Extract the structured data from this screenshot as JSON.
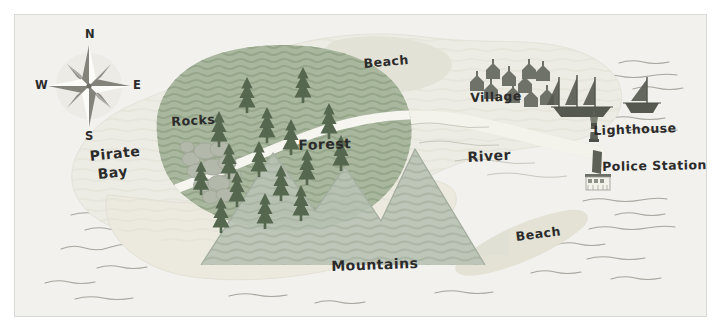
{
  "map": {
    "title": "Pirate Island Map",
    "style": "hand-drawn illustrated map",
    "colors": {
      "paper": "#f3f2ee",
      "water": "#f0efec",
      "sand": "#ecebe4",
      "land": "#e6e5dc",
      "beach_highlight": "#e2e1d6",
      "forest": "#a9b79e",
      "forest_dark": "#9aa98e",
      "tree": "#55684f",
      "mountain": "#b9c2b4",
      "mountain_dark": "#a8b2a2",
      "rocks": "#b0b7a8",
      "river": "#f7f7f4",
      "ink": "#2b2b2b",
      "wave": "#8d8d86",
      "border": "#d8d8d6",
      "building": "#6e7268",
      "lighthouse_body": "#5c6057",
      "police_roof": "#6b6f66"
    },
    "labels": [
      {
        "id": "pirate-bay",
        "text": "Pirate",
        "x": 88,
        "y": 148,
        "size": "lg",
        "rotate": -6
      },
      {
        "id": "pirate-bay-2",
        "text": "Bay",
        "x": 96,
        "y": 168,
        "size": "lg",
        "rotate": -6
      },
      {
        "id": "rocks",
        "text": "Rocks",
        "x": 170,
        "y": 113,
        "size": "md",
        "rotate": -3
      },
      {
        "id": "forest",
        "text": "Forest",
        "x": 297,
        "y": 136,
        "size": "lg",
        "rotate": -2
      },
      {
        "id": "beach-north",
        "text": "Beach",
        "x": 362,
        "y": 55,
        "size": "md",
        "rotate": -5
      },
      {
        "id": "village",
        "text": "Village",
        "x": 469,
        "y": 89,
        "size": "md",
        "rotate": -2
      },
      {
        "id": "river",
        "text": "River",
        "x": 466,
        "y": 148,
        "size": "lg",
        "rotate": -3
      },
      {
        "id": "lighthouse",
        "text": "Lighthouse",
        "x": 592,
        "y": 122,
        "size": "md",
        "rotate": -2
      },
      {
        "id": "police-station",
        "text": "Police Station",
        "x": 601,
        "y": 158,
        "size": "md",
        "rotate": -1
      },
      {
        "id": "beach-south",
        "text": "Beach",
        "x": 514,
        "y": 228,
        "size": "md",
        "rotate": -7
      },
      {
        "id": "mountains",
        "text": "Mountains",
        "x": 330,
        "y": 257,
        "size": "lg",
        "rotate": -2
      }
    ],
    "compass": {
      "center_x": 88,
      "center_y": 85,
      "radius": 36,
      "north": "N",
      "east": "E",
      "south": "S",
      "west": "W"
    },
    "features": {
      "village_house_count": 10,
      "forest_tree_count": 16,
      "mountain_peak_count": 4,
      "ships": [
        {
          "name": "three-masted-ship",
          "masts": 3,
          "x": 568,
          "y": 92
        },
        {
          "name": "sailboat",
          "masts": 1,
          "x": 632,
          "y": 88
        }
      ],
      "lighthouse": {
        "x": 580,
        "y": 118
      },
      "police_station": {
        "x": 583,
        "y": 152
      },
      "rocks_cluster": {
        "x": 192,
        "y": 150
      },
      "water_wave_rows": 14
    }
  }
}
